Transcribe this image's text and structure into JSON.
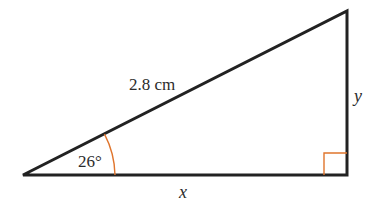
{
  "diagram": {
    "type": "right-triangle",
    "hypotenuse_label": "2.8 cm",
    "angle_label": "26°",
    "base_label": "x",
    "height_label": "y",
    "colors": {
      "line": "#222222",
      "angle_marker": "#e0752d",
      "text": "#2b2b2b"
    }
  }
}
